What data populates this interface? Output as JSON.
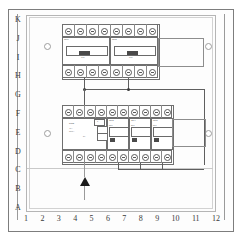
{
  "drawing": {
    "title": "Electrical Distribution Panel Layout",
    "type": "consumer-unit-assembly-drawing"
  },
  "grid": {
    "row_letters": [
      "K",
      "J",
      "I",
      "H",
      "G",
      "F",
      "E",
      "D",
      "C",
      "B",
      "A"
    ],
    "column_numbers": [
      "1",
      "2",
      "3",
      "4",
      "5",
      "6",
      "7",
      "8",
      "9",
      "10",
      "11",
      "12"
    ]
  },
  "colors": {
    "line": "#5f5f5f",
    "frame": "#7d7d7d",
    "module_border": "#6f6f6f",
    "terminal": "#585858",
    "arrow": "#1b1b1b",
    "background": "#ffffff"
  },
  "upper_assembly": {
    "name": "upper-din-rail",
    "breakers": [
      {
        "id": "Q1",
        "label": "QF1",
        "rating": "C16",
        "poles": 4
      },
      {
        "id": "Q2",
        "label": "QF2",
        "rating": "C16",
        "poles": 4
      }
    ],
    "terminal_count_top": 8,
    "terminal_count_bottom": 8
  },
  "lower_assembly": {
    "name": "lower-din-rail",
    "rcd": {
      "id": "FI",
      "label": "RCD",
      "rating": "40A",
      "sensitivity": "30mA",
      "test_label": "T"
    },
    "breakers": [
      {
        "id": "Q3",
        "label": "QF3",
        "rating": "B16"
      },
      {
        "id": "Q4",
        "label": "QF4",
        "rating": "B16"
      },
      {
        "id": "Q5",
        "label": "QF5",
        "rating": "B10"
      }
    ],
    "terminal_count_top": 10,
    "terminal_count_bottom": 10
  },
  "supply": {
    "name": "incoming-supply",
    "symbol": "arrow-up"
  }
}
